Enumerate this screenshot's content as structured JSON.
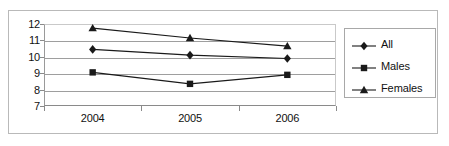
{
  "chart_data": {
    "type": "line",
    "title": "",
    "xlabel": "",
    "ylabel": "",
    "categories": [
      "2004",
      "2005",
      "2006"
    ],
    "ylim": [
      7,
      12
    ],
    "yticks": [
      7,
      8,
      9,
      10,
      11,
      12
    ],
    "ytick_labels": [
      "7",
      "8",
      "9",
      "10",
      "11",
      "12"
    ],
    "grid": true,
    "legend_position": "right",
    "series": [
      {
        "name": "All",
        "marker": "diamond",
        "color": "#1a1a1a",
        "values": [
          10.45,
          10.1,
          9.9
        ]
      },
      {
        "name": "Males",
        "marker": "square",
        "color": "#1a1a1a",
        "values": [
          9.05,
          8.35,
          8.9
        ]
      },
      {
        "name": "Females",
        "marker": "triangle",
        "color": "#1a1a1a",
        "values": [
          11.75,
          11.15,
          10.65
        ]
      }
    ]
  },
  "legend": {
    "items": [
      {
        "label": "All",
        "marker": "diamond"
      },
      {
        "label": "Males",
        "marker": "square"
      },
      {
        "label": "Females",
        "marker": "triangle"
      }
    ]
  },
  "colors": {
    "series_line": "#1a1a1a",
    "gridline": "#9e9e9e",
    "axis": "#8a8a8a",
    "frame": "#b9b9b9",
    "text": "#111111",
    "background": "#ffffff"
  }
}
